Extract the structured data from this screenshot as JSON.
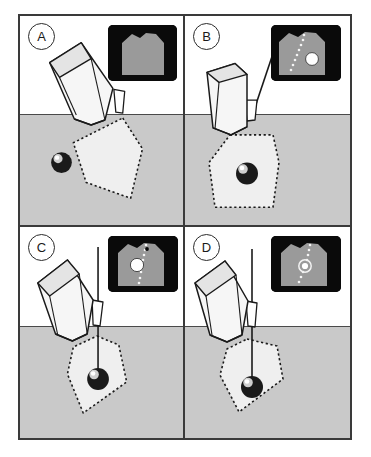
{
  "figure": {
    "panel_count": 4,
    "layout": "2x2 grid",
    "colors": {
      "frame_border": "#3a3a3a",
      "skin_surface_line": "#4a4a4a",
      "tissue_fill": "#c9c9c9",
      "background": "#ffffff",
      "beam_fill": "#efefef",
      "beam_outline": "#1a1a1a",
      "probe_fill": "#f2f2f2",
      "probe_outline": "#1a1a1a",
      "needle": "#1a1a1a",
      "target_sphere_dark": "#111111",
      "target_sphere_highlight": "#ffffff",
      "inset_background": "#0a0a0a",
      "inset_tissue": "#9a9a9a",
      "inset_track_dots": "#f2f2f2",
      "inset_target": "#ffffff"
    }
  },
  "panels": [
    {
      "id": "A",
      "label": "A",
      "description": "Transducer tilted on skin surface; scan plane shown as dotted fan in tissue; target lesion sphere lies outside the scan plane to the left.",
      "needle_present": false,
      "target_in_beam": false,
      "inset": {
        "name": "ultrasound-screen-a",
        "shows_target": false,
        "shows_needle_track": false,
        "description": "Grey tissue sector on black background, no target and no needle track visible."
      }
    },
    {
      "id": "B",
      "label": "B",
      "description": "Transducer held upright; scan plane now contains the target sphere; needle aligned in the guide above the skin, not yet advanced.",
      "needle_present": true,
      "needle_advanced": false,
      "target_in_beam": true,
      "inset": {
        "name": "ultrasound-screen-b",
        "shows_target": true,
        "shows_needle_track": true,
        "description": "Grey tissue sector with dotted needle guide track and white round target to the right of the track."
      }
    },
    {
      "id": "C",
      "label": "C",
      "description": "Transducer tilted again; needle advanced through the guide into the tissue along the scan plane; needle tip approaching the target.",
      "needle_present": true,
      "needle_advanced": true,
      "target_in_beam": true,
      "inset": {
        "name": "ultrasound-screen-c",
        "shows_target": true,
        "shows_needle_track": true,
        "description": "Grey tissue sector with dotted needle track and large white target circle at mid depth, track passing beside it."
      }
    },
    {
      "id": "D",
      "label": "D",
      "description": "Needle fully advanced; tip engaged within the target lesion inside the scan plane.",
      "needle_present": true,
      "needle_advanced": true,
      "needle_in_target": true,
      "target_in_beam": true,
      "inset": {
        "name": "ultrasound-screen-d",
        "shows_target": true,
        "shows_needle_track": true,
        "needle_tip_in_target": true,
        "description": "Grey tissue sector with dotted needle track ending in a small bright tip inside the circular target."
      }
    }
  ]
}
